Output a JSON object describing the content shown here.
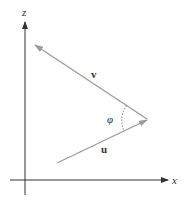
{
  "diagram": {
    "axes": {
      "z": {
        "label": "z"
      },
      "x": {
        "label": "x"
      }
    },
    "vectors": [
      {
        "name": "v",
        "label": "v",
        "color": "#9a9a9a"
      },
      {
        "name": "u",
        "label": "u",
        "color": "#9a9a9a"
      }
    ],
    "angle": {
      "label": "φ"
    },
    "colors": {
      "axis": "#333333",
      "vector": "#9a9a9a",
      "arc": "#555555"
    }
  }
}
